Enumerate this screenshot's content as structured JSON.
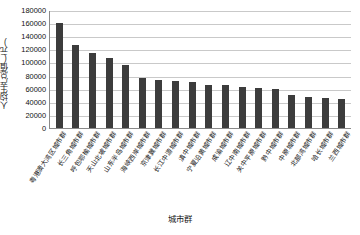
{
  "chart_data": {
    "type": "bar",
    "title": "",
    "xlabel": "城市群",
    "ylabel": "人均生产总值(元)",
    "ylim": [
      0,
      180000
    ],
    "ytick_step": 20000,
    "yticks": [
      "180000",
      "160000",
      "140000",
      "120000",
      "100000",
      "80000",
      "60000",
      "40000",
      "20000",
      "0"
    ],
    "grid": "horizontal",
    "legend": "none",
    "bar_color": "#3c3c3c",
    "categories": [
      "粤港澳大湾区城市群",
      "长三角城市群",
      "呼包鄂榆城市群",
      "天山北坡城市群",
      "山东半岛城市群",
      "海峡西岸城市群",
      "京津冀城市群",
      "长江中游城市群",
      "滇中城市群",
      "宁夏沿黄城市群",
      "成渝城市群",
      "辽中南城市群",
      "关中平原城市群",
      "黔中城市群",
      "中原城市群",
      "北部湾城市群",
      "哈长城市群",
      "兰西城市群"
    ],
    "values": [
      160000,
      127000,
      115000,
      107000,
      96000,
      76000,
      74000,
      71000,
      70000,
      66000,
      65000,
      63000,
      61000,
      59000,
      51000,
      48000,
      46000,
      44000
    ]
  },
  "axes": {
    "y_title": "人均生产总值(元)",
    "x_title": "城市群"
  }
}
